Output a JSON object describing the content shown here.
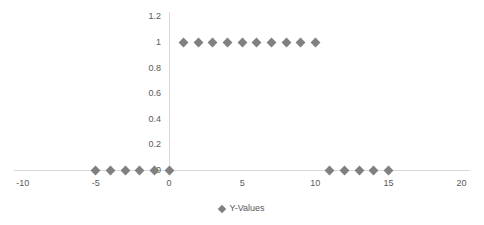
{
  "chart_data": {
    "type": "scatter",
    "title": "",
    "xlabel": "",
    "ylabel": "",
    "grid": false,
    "legend_position": "bottom",
    "legend": [
      "Y-Values"
    ],
    "marker": "diamond",
    "marker_color": "#808080",
    "axis_color": "#d9d9d9",
    "label_color": "#595959",
    "background": "#ffffff",
    "xlim": [
      -10,
      20
    ],
    "ylim": [
      0,
      1.2
    ],
    "xticks": [
      -10,
      -5,
      0,
      5,
      10,
      15,
      20
    ],
    "xtick_labels": [
      "-10",
      "-5",
      "0",
      "5",
      "10",
      "15",
      "20"
    ],
    "yticks": [
      0,
      0.2,
      0.4,
      0.6,
      0.8,
      1,
      1.2
    ],
    "ytick_labels": [
      "0",
      "0.2",
      "0.4",
      "0.6",
      "0.8",
      "1",
      "1.2"
    ],
    "series": [
      {
        "name": "Y-Values",
        "x": [
          -5,
          -4,
          -3,
          -2,
          -1,
          0,
          1,
          2,
          3,
          4,
          5,
          6,
          7,
          8,
          9,
          10,
          11,
          12,
          13,
          14,
          15
        ],
        "values": [
          0,
          0,
          0,
          0,
          0,
          0,
          1,
          1,
          1,
          1,
          1,
          1,
          1,
          1,
          1,
          1,
          0,
          0,
          0,
          0,
          0
        ]
      }
    ]
  }
}
